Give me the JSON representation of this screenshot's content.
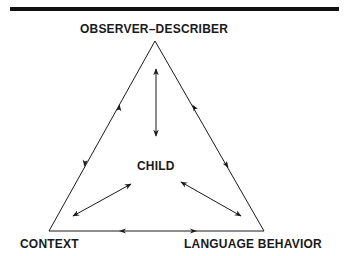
{
  "diagram": {
    "type": "triangle-relationship",
    "nodes": {
      "top": "OBSERVER–DESCRIBER",
      "center": "CHILD",
      "bottom_left": "CONTEXT",
      "bottom_right": "LANGUAGE BEHAVIOR"
    },
    "edges": [
      {
        "from": "OBSERVER–DESCRIBER",
        "to": "CONTEXT",
        "direction": "bidirectional"
      },
      {
        "from": "OBSERVER–DESCRIBER",
        "to": "LANGUAGE BEHAVIOR",
        "direction": "bidirectional"
      },
      {
        "from": "CONTEXT",
        "to": "LANGUAGE BEHAVIOR",
        "direction": "bidirectional"
      },
      {
        "from": "CHILD",
        "to": "OBSERVER–DESCRIBER",
        "direction": "bidirectional"
      },
      {
        "from": "CHILD",
        "to": "CONTEXT",
        "direction": "bidirectional"
      },
      {
        "from": "CHILD",
        "to": "LANGUAGE BEHAVIOR",
        "direction": "bidirectional"
      }
    ],
    "colors": {
      "ink": "#1a1a1a",
      "background": "#ffffff"
    }
  }
}
